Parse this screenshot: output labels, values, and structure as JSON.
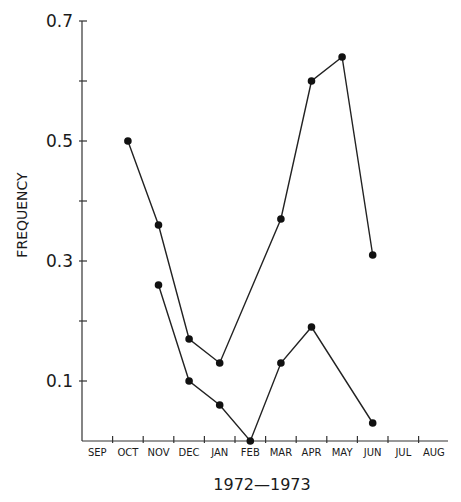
{
  "chart_data": {
    "type": "line",
    "title": "",
    "xlabel": "1972—1973",
    "ylabel": "FREQUENCY",
    "categories": [
      "SEP",
      "OCT",
      "NOV",
      "DEC",
      "JAN",
      "FEB",
      "MAR",
      "APR",
      "MAY",
      "JUN",
      "JUL",
      "AUG"
    ],
    "ylim": [
      0,
      0.7
    ],
    "yticks": [
      0.1,
      0.2,
      0.3,
      0.4,
      0.5,
      0.6,
      0.7
    ],
    "ytick_labels": [
      "0.1",
      "",
      "0.3",
      "",
      "0.5",
      "",
      "0.7"
    ],
    "grid": false,
    "legend": null,
    "series": [
      {
        "name": "Upper series",
        "values": [
          null,
          0.5,
          0.36,
          0.17,
          0.13,
          null,
          0.37,
          0.6,
          0.64,
          0.31,
          null,
          null
        ]
      },
      {
        "name": "Lower series",
        "values": [
          null,
          null,
          0.26,
          0.1,
          0.06,
          0.0,
          0.13,
          0.19,
          null,
          0.03,
          null,
          null
        ]
      }
    ]
  }
}
